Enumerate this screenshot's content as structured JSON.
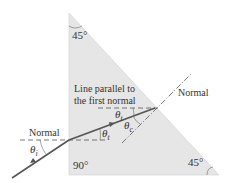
{
  "diagram": {
    "prism_fill": "#e8e8e8",
    "ray_color": "#555555",
    "labels": {
      "top_angle": "45°",
      "bottom_left_angle": "90°",
      "bottom_right_angle": "45°",
      "normal_left": "Normal",
      "normal_right": "Normal",
      "parallel_line_1": "Line parallel to",
      "parallel_line_2": "the first normal",
      "theta_i": "θ",
      "theta_i_sub": "i",
      "theta_t_entry": "θ",
      "theta_t_entry_sub": "t",
      "theta_t_second": "θ",
      "theta_t_second_sub": "t",
      "theta_c": "θ",
      "theta_c_sub": "c"
    }
  }
}
